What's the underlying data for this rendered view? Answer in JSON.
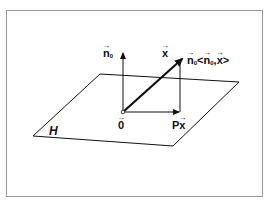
{
  "diagram": {
    "type": "vector-projection-onto-hyperplane",
    "plane_label": "H",
    "labels": {
      "normal": {
        "base": "n",
        "sub": "0"
      },
      "vector": {
        "base": "x"
      },
      "origin": {
        "base": "0"
      },
      "projection": {
        "prefix": "P",
        "base": "x"
      },
      "component": {
        "base": "n",
        "sub": "0",
        "bracket_open": "<",
        "inner_base": "n",
        "inner_sub": "0",
        "sep": ",",
        "inner_vec": "x",
        "bracket_close": ">"
      }
    },
    "colors": {
      "stroke": "#111111",
      "frame": "#9a9a9a",
      "background": "#ffffff"
    }
  }
}
